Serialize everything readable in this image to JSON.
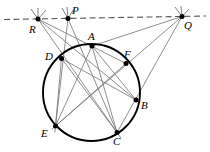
{
  "figure": {
    "type": "euclidean-geometry-diagram",
    "stroke_color": "#000000",
    "chord_color": "#7a7a7a",
    "circle_color": "#000000",
    "dashed_line_color": "#555555",
    "background": "#ffffff"
  },
  "circle": {
    "cx": 91.5,
    "cy": 92.5,
    "r": 48.5
  },
  "dashed_line": {
    "x1": 4,
    "y1": 19.5,
    "x2": 206,
    "y2": 16.0,
    "label": "polar-line-PQR"
  },
  "points": [
    {
      "id": "A",
      "label": "A",
      "x": 92.0,
      "y": 46.0,
      "lx": 88.0,
      "ly": 31.0,
      "on_circle": true
    },
    {
      "id": "B",
      "label": "B",
      "x": 136.0,
      "y": 100.0,
      "lx": 141.0,
      "ly": 100.0,
      "on_circle": true
    },
    {
      "id": "C",
      "label": "C",
      "x": 117.0,
      "y": 132.5,
      "lx": 113.0,
      "ly": 136.0,
      "on_circle": true
    },
    {
      "id": "D",
      "label": "D",
      "x": 61.5,
      "y": 58.5,
      "lx": 45.0,
      "ly": 51.0,
      "on_circle": true
    },
    {
      "id": "E",
      "label": "E",
      "x": 55.5,
      "y": 126.0,
      "lx": 41.0,
      "ly": 128.0,
      "on_circle": true
    },
    {
      "id": "F",
      "label": "F",
      "x": 126.0,
      "y": 63.5,
      "lx": 124.0,
      "ly": 49.0,
      "on_circle": true
    },
    {
      "id": "P",
      "label": "P",
      "x": 68.0,
      "y": 18.5,
      "lx": 72.0,
      "ly": 5.0,
      "on_circle": false
    },
    {
      "id": "Q",
      "label": "Q",
      "x": 182.0,
      "y": 16.5,
      "lx": 184.0,
      "ly": 20.0,
      "on_circle": false
    },
    {
      "id": "R",
      "label": "R",
      "x": 38.0,
      "y": 19.0,
      "lx": 29.0,
      "ly": 24.0,
      "on_circle": false
    }
  ],
  "chords": [
    {
      "id": "AE",
      "from": "A",
      "to": "E"
    },
    {
      "id": "AC",
      "from": "A",
      "to": "C"
    },
    {
      "id": "AB",
      "from": "A",
      "to": "B"
    },
    {
      "id": "DB",
      "from": "D",
      "to": "B"
    },
    {
      "id": "DC",
      "from": "D",
      "to": "C"
    },
    {
      "id": "EF",
      "from": "E",
      "to": "F"
    },
    {
      "id": "DE",
      "from": "D",
      "to": "E"
    }
  ],
  "secants": [
    {
      "id": "P-D-E",
      "from": "P",
      "through": "D",
      "to": "E"
    },
    {
      "id": "P-A-C",
      "from": "P",
      "through": "A",
      "to": "C"
    },
    {
      "id": "R-D-B",
      "from": "R",
      "through": "D",
      "to": "B"
    },
    {
      "id": "R-A-F",
      "from": "R",
      "through": "A",
      "to": "F"
    },
    {
      "id": "R-D-C",
      "from": "R",
      "through": "D",
      "to": "C"
    },
    {
      "id": "Q-A-F",
      "from": "Q",
      "through": "F",
      "to": "A"
    },
    {
      "id": "Q-B-C",
      "from": "Q",
      "through": "B",
      "to": "C"
    },
    {
      "id": "Q-E-F",
      "from": "Q",
      "through": "F",
      "to": "E"
    }
  ],
  "tick_marks": {
    "P": [
      [
        62,
        8
      ],
      [
        67,
        7
      ],
      [
        74,
        9
      ]
    ],
    "Q": [
      [
        175,
        7
      ],
      [
        181,
        6
      ],
      [
        189,
        9
      ]
    ],
    "R": [
      [
        31,
        9
      ],
      [
        38,
        8
      ],
      [
        46,
        10
      ]
    ]
  }
}
